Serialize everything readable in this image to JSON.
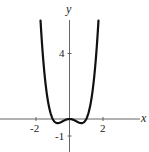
{
  "chart_data": {
    "type": "line",
    "title": "",
    "function": "y = x^4 - x^2",
    "xlabel": "x",
    "ylabel": "y",
    "x_ticks": [
      {
        "value": -2,
        "label": "-2"
      },
      {
        "value": 2,
        "label": "2"
      }
    ],
    "y_ticks": [
      {
        "value": 4,
        "label": "4"
      },
      {
        "value": -1,
        "label": "-1"
      }
    ],
    "xlim": [
      -4.1,
      4.7
    ],
    "ylim": [
      -2,
      7.2
    ],
    "grid": false,
    "legend": null,
    "series": [
      {
        "name": "f(x)",
        "x": [
          -1.73,
          -1.6,
          -1.4,
          -1.2,
          -1.0,
          -0.85,
          -0.707,
          -0.5,
          -0.3,
          0,
          0.3,
          0.5,
          0.707,
          0.85,
          1.0,
          1.2,
          1.4,
          1.6,
          1.73
        ],
        "y": [
          5.96,
          3.99,
          1.88,
          0.63,
          0.0,
          -0.2,
          -0.25,
          -0.19,
          -0.08,
          0,
          -0.08,
          -0.19,
          -0.25,
          -0.2,
          0.0,
          0.63,
          1.88,
          3.99,
          5.96
        ]
      }
    ],
    "features": {
      "local_max": [
        0,
        0
      ],
      "local_min": [
        [
          -0.707,
          -0.25
        ],
        [
          0.707,
          -0.25
        ]
      ]
    }
  },
  "labels": {
    "x_axis": "x",
    "y_axis": "y",
    "tick_neg2": "-2",
    "tick_2": "2",
    "tick_4": "4",
    "tick_neg1": "-1"
  }
}
